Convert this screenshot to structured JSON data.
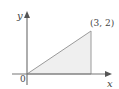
{
  "diagram": {
    "type": "region-plot",
    "axes": {
      "x_label": "x",
      "y_label": "y",
      "origin_label": "0"
    },
    "region": {
      "shape": "triangle",
      "vertices": [
        [
          0,
          0
        ],
        [
          3,
          0
        ],
        [
          3,
          2
        ]
      ],
      "fill": "#eeeeee",
      "stroke": "#999999"
    },
    "point_label": "(3, 2)",
    "colors": {
      "axis": "#777777",
      "text": "#444444"
    }
  }
}
